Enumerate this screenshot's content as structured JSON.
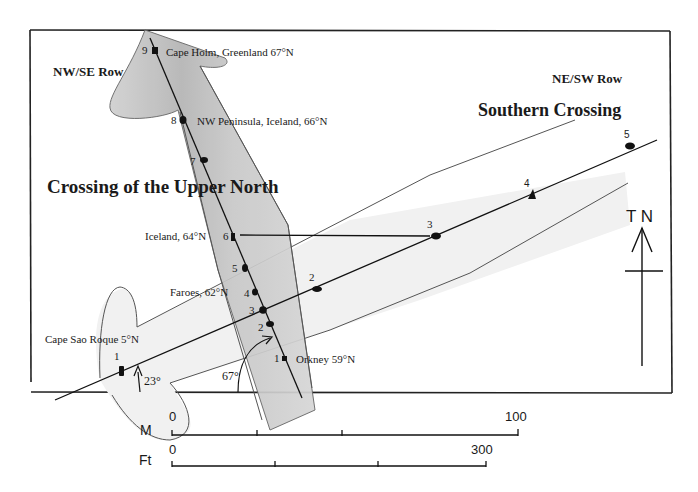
{
  "labels": {
    "nwse_row": "NW/SE Row",
    "nesw_row": "NE/SW Row",
    "upper_north_title": "Crossing of the Upper North",
    "southern_title": "Southern Crossing",
    "north_marker": "T N",
    "angle_small": "23°",
    "angle_large": "67°"
  },
  "upper_north_points": [
    {
      "num": "1",
      "place": "Orkney 59°N"
    },
    {
      "num": "2",
      "place": ""
    },
    {
      "num": "3",
      "place": ""
    },
    {
      "num": "4",
      "place": "Faroes, 62°N"
    },
    {
      "num": "5",
      "place": ""
    },
    {
      "num": "6",
      "place": "Iceland, 64°N"
    },
    {
      "num": "7",
      "place": ""
    },
    {
      "num": "8",
      "place": "NW Peninsula, Iceland, 66°N"
    },
    {
      "num": "9",
      "place": "Cape Holm, Greenland 67°N"
    }
  ],
  "southern_points": [
    {
      "num": "1",
      "place": "Cape Sao Roque 5°N"
    },
    {
      "num": "2",
      "place": ""
    },
    {
      "num": "3",
      "place": ""
    },
    {
      "num": "4",
      "place": ""
    },
    {
      "num": "5",
      "place": ""
    }
  ],
  "scale": {
    "meters_label": "M",
    "meters_start": "0",
    "meters_end": "100",
    "feet_label": "Ft",
    "feet_start": "0",
    "feet_end": "300"
  },
  "colors": {
    "band_fill": "#c4c4c4",
    "band_dark": "#a8a8a8",
    "southern_fill": "#efefef",
    "line": "#1a1a1a"
  }
}
